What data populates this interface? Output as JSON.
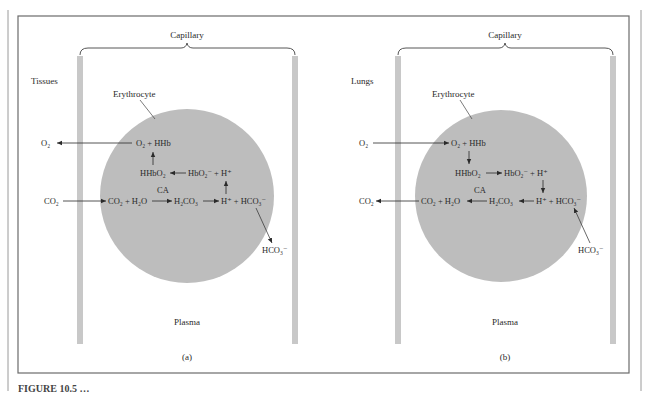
{
  "figure": {
    "colors": {
      "background": "#ffffff",
      "frame": "#6b6b6b",
      "capillary_wall": "#c8c8c8",
      "erythrocyte": "#bdbdbd",
      "text": "#2a2a2a"
    },
    "panels": [
      {
        "id": "a",
        "panel_label": "(a)",
        "region_label": "Tissues",
        "capillary_label": "Capillary",
        "cell_label": "Erythrocyte",
        "plasma_label": "Plasma",
        "outside_o2": "O₂",
        "outside_co2": "CO₂",
        "outside_hco3": "HCO₃⁻",
        "row1": "O₂ + HHb",
        "row2_left": "HHbO₂",
        "row2_right": "HbO₂⁻ + H⁺",
        "row3_a": "CO₂ + H₂O",
        "row3_b": "H₂CO₃",
        "row3_c": "H⁺ + HCO₃⁻",
        "enzyme": "CA"
      },
      {
        "id": "b",
        "panel_label": "(b)",
        "region_label": "Lungs",
        "capillary_label": "Capillary",
        "cell_label": "Erythrocyte",
        "plasma_label": "Plasma",
        "outside_o2": "O₂",
        "outside_co2": "CO₂",
        "outside_hco3": "HCO₃⁻",
        "row1": "O₂ + HHb",
        "row2_left": "HHbO₂",
        "row2_right": "HbO₂⁻ + H⁺",
        "row3_a": "CO₂ + H₂O",
        "row3_b": "H₂CO₃",
        "row3_c": "H⁺ + HCO₃⁻",
        "enzyme": "CA"
      }
    ],
    "caption_fragment": "FIGURE 10.5 …"
  }
}
